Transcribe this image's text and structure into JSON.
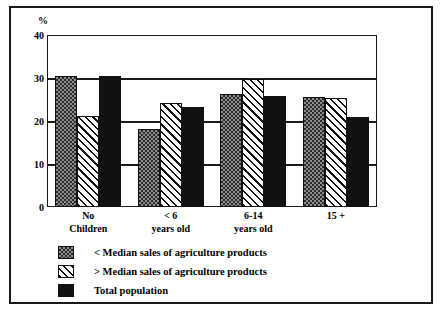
{
  "chart_data": {
    "type": "bar",
    "title": "",
    "subtitle": "",
    "xlabel": "",
    "ylabel": "%",
    "ylim": [
      0,
      40
    ],
    "ytick_labels": [
      "40",
      "30",
      "20",
      "10",
      "0"
    ],
    "ytick_values": [
      40,
      30,
      20,
      10,
      0
    ],
    "grid": true,
    "legend_position": "bottom-left",
    "categories": [
      "No Children",
      "< 6 years old",
      "6-14 years old",
      "15 +"
    ],
    "category_lines": [
      {
        "line1": "No",
        "line2": "Children"
      },
      {
        "line1": "< 6",
        "line2": "years old"
      },
      {
        "line1": "6-14",
        "line2": "years old"
      },
      {
        "line1": "15 +",
        "line2": ""
      }
    ],
    "series": [
      {
        "name": "< Median sales of agriculture products",
        "pattern": "checkered",
        "color": "#8e8e8e",
        "values": [
          30.5,
          18.2,
          26.2,
          25.7
        ]
      },
      {
        "name": "> Median sales of agriculture products",
        "pattern": "diagonal-hatch",
        "color": "#ffffff",
        "values": [
          21.2,
          24.3,
          29.7,
          25.4
        ]
      },
      {
        "name": "Total population",
        "pattern": "solid",
        "color": "#111111",
        "values": [
          30.5,
          23.3,
          25.8,
          21.0
        ]
      }
    ]
  },
  "legend": {
    "items": [
      {
        "label": "< Median sales of agriculture products",
        "swatch": "checkered-swatch"
      },
      {
        "label": "> Median sales of agriculture products",
        "swatch": "hatch-swatch"
      },
      {
        "label": "Total population",
        "swatch": "solid-swatch"
      }
    ]
  },
  "axis": {
    "unit_label": "%"
  },
  "caption_bleed": ""
}
